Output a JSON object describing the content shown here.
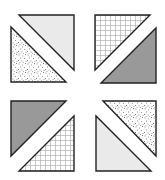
{
  "canvas": {
    "width": 165,
    "height": 180,
    "background": "#ffffff"
  },
  "fills": {
    "light-weave": {
      "base": "#dcdcdc",
      "line": "#ffffff",
      "label": "light gray basket-weave"
    },
    "dark-weave": {
      "base": "#7a7a7a",
      "line": "#c8c8c8",
      "label": "dark gray basket-weave"
    },
    "speckle": {
      "base": "#ffffff",
      "dot": "#8a8a8a",
      "label": "speckled dots"
    },
    "grid": {
      "base": "#ffffff",
      "line": "#b0b0b0",
      "label": "fine grid"
    }
  },
  "outline_color": "#222222",
  "blocks": [
    {
      "name": "top-left",
      "triangles": [
        {
          "name": "top-left-upper",
          "fill": "light-weave",
          "points": "19,15 74,15 74,70"
        },
        {
          "name": "top-left-lower",
          "fill": "speckle",
          "points": "11,27 11,82 66,82"
        }
      ]
    },
    {
      "name": "top-right",
      "triangles": [
        {
          "name": "top-right-upper",
          "fill": "grid",
          "points": "95,15 150,15 95,70"
        },
        {
          "name": "top-right-lower",
          "fill": "dark-weave",
          "points": "156,28 156,83 101,83"
        }
      ]
    },
    {
      "name": "bottom-left",
      "triangles": [
        {
          "name": "bottom-left-upper",
          "fill": "dark-weave",
          "points": "11,101 66,101 11,156"
        },
        {
          "name": "bottom-left-lower",
          "fill": "grid",
          "points": "74,116 74,171 19,171"
        }
      ]
    },
    {
      "name": "bottom-right",
      "triangles": [
        {
          "name": "bottom-right-upper",
          "fill": "speckle",
          "points": "103,101 156,101 156,156"
        },
        {
          "name": "bottom-right-lower",
          "fill": "light-weave",
          "points": "96,116 96,171 151,171"
        }
      ]
    }
  ]
}
